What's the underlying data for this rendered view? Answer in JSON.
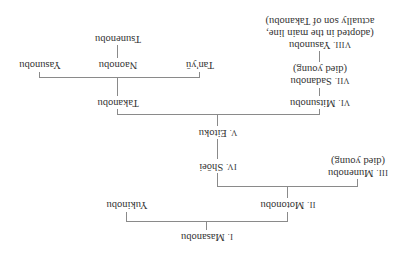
{
  "diagram": {
    "title": "",
    "orientation": "rotated-180",
    "nodes": {
      "masanobu": {
        "numeral": "I.",
        "name": "Masanobu",
        "note": ""
      },
      "motonobu": {
        "numeral": "II.",
        "name": "Motonobu",
        "note": ""
      },
      "yukinobu": {
        "numeral": "",
        "name": "Yukinobu",
        "note": ""
      },
      "munenobu": {
        "numeral": "III.",
        "name": "Munenobu",
        "note": "(died young)"
      },
      "shoei": {
        "numeral": "IV.",
        "name": "Shōei",
        "note": ""
      },
      "eitoku": {
        "numeral": "V.",
        "name": "Eitoku",
        "note": ""
      },
      "mitsunobu": {
        "numeral": "VI.",
        "name": "Mitsunobu",
        "note": ""
      },
      "takanobu": {
        "numeral": "",
        "name": "Takanobu",
        "note": ""
      },
      "sadanobu": {
        "numeral": "VII.",
        "name": "Sadanobu",
        "note": "(died young)"
      },
      "yasunobu_viii": {
        "numeral": "VIII.",
        "name": "Yasunobu",
        "note1": "(adopted in the main line,",
        "note2": "actually son of Takanobu)"
      },
      "tanyu": {
        "numeral": "",
        "name": "Tan'yū",
        "note": ""
      },
      "naonobu": {
        "numeral": "",
        "name": "Naonobu",
        "note": ""
      },
      "yasunobu": {
        "numeral": "",
        "name": "Yasunobu",
        "note": ""
      },
      "tsunenobu": {
        "numeral": "",
        "name": "Tsunenobu",
        "note": ""
      }
    },
    "edges": [
      [
        "masanobu",
        "motonobu"
      ],
      [
        "masanobu",
        "yukinobu"
      ],
      [
        "motonobu",
        "munenobu"
      ],
      [
        "motonobu",
        "shoei"
      ],
      [
        "shoei",
        "eitoku"
      ],
      [
        "eitoku",
        "mitsunobu"
      ],
      [
        "eitoku",
        "takanobu"
      ],
      [
        "mitsunobu",
        "sadanobu"
      ],
      [
        "sadanobu",
        "yasunobu_viii"
      ],
      [
        "takanobu",
        "tanyu"
      ],
      [
        "takanobu",
        "naonobu"
      ],
      [
        "takanobu",
        "yasunobu"
      ],
      [
        "naonobu",
        "tsunenobu"
      ]
    ],
    "line_color": "#8a8a8a",
    "text_color": "#333333"
  }
}
